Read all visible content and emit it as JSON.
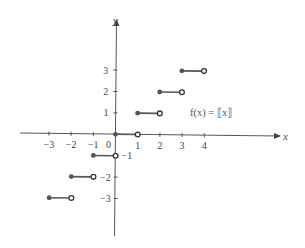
{
  "chart_data": {
    "type": "line",
    "title": "",
    "function_label": "f(x) = ⟦x⟧",
    "xlabel": "x",
    "ylabel": "y",
    "x_ticks": [
      -3,
      -2,
      -1,
      0,
      1,
      2,
      3,
      4
    ],
    "x_tick_labels": [
      "−3",
      "−2",
      "−1",
      "0",
      "1",
      "2",
      "3",
      "4"
    ],
    "y_ticks": [
      3,
      2,
      1,
      -1,
      -2,
      -3
    ],
    "y_tick_labels": [
      "3",
      "2",
      "1",
      "−1",
      "−2",
      "−3"
    ],
    "xlim": [
      -4.3,
      7.5
    ],
    "ylim": [
      -4.7,
      5.3
    ],
    "grid": false,
    "series": [
      {
        "name": "greatest integer function",
        "segments": [
          {
            "x_start": -3,
            "x_end": -2,
            "y": -3,
            "start_closed": true,
            "end_closed": false
          },
          {
            "x_start": -2,
            "x_end": -1,
            "y": -2,
            "start_closed": true,
            "end_closed": false
          },
          {
            "x_start": -1,
            "x_end": 0,
            "y": -1,
            "start_closed": true,
            "end_closed": false
          },
          {
            "x_start": 0,
            "x_end": 1,
            "y": 0,
            "start_closed": true,
            "end_closed": false
          },
          {
            "x_start": 1,
            "x_end": 2,
            "y": 1,
            "start_closed": true,
            "end_closed": false
          },
          {
            "x_start": 2,
            "x_end": 3,
            "y": 2,
            "start_closed": true,
            "end_closed": false
          },
          {
            "x_start": 3,
            "x_end": 4,
            "y": 3,
            "start_closed": true,
            "end_closed": false
          }
        ]
      }
    ]
  },
  "colors": {
    "axis": "#555555",
    "segment": "#555555",
    "closed_dot": "#555555",
    "open_dot_fill": "#ffffff",
    "text": "#444444"
  }
}
